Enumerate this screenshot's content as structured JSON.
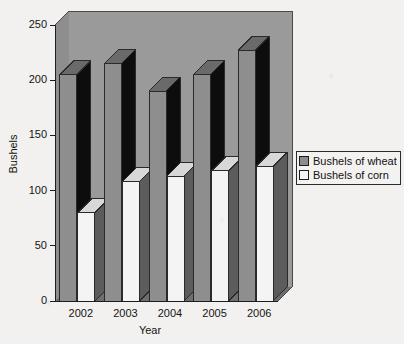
{
  "chart_data": {
    "type": "bar",
    "title": "",
    "subtitle": "",
    "xlabel": "Year",
    "ylabel": "Bushels",
    "categories": [
      "2002",
      "2003",
      "2004",
      "2005",
      "2006"
    ],
    "series": [
      {
        "name": "Bushels of wheat",
        "values": [
          205,
          215,
          190,
          205,
          227
        ],
        "color": "#8c8c8c"
      },
      {
        "name": "Bushels of corn",
        "values": [
          80,
          108,
          113,
          118,
          122
        ],
        "color": "#f2f2f2"
      }
    ],
    "ylim": [
      0,
      250
    ],
    "yticks": [
      0,
      50,
      100,
      150,
      200,
      250
    ],
    "ytick_labels": [
      "0",
      "50",
      "100",
      "150",
      "200",
      "250"
    ],
    "grid": false,
    "legend_position": "right",
    "three_d": true,
    "plot_background": "#9a9a9a",
    "floor_color": "#6e6e6e",
    "shadow_color": "#111111"
  },
  "axes": {
    "y_title": "Bushels",
    "x_title": "Year"
  },
  "legend": {
    "entries": [
      {
        "label": "Bushels of wheat",
        "swatch": "#8c8c8c"
      },
      {
        "label": "Bushels of corn",
        "swatch": "#f4f4f4"
      }
    ]
  }
}
